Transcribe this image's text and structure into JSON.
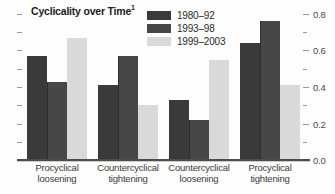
{
  "title": {
    "text": "Cyclicality over Time",
    "footnote_marker": "1"
  },
  "chart_data": {
    "type": "bar",
    "title": "Cyclicality over Time",
    "categories": [
      "Procyclical loosening",
      "Countercyclical tightening",
      "Countercyclical loosening",
      "Procyclical tightening"
    ],
    "series": [
      {
        "name": "1980–92",
        "color": "#3a3a3a",
        "values": [
          0.57,
          0.41,
          0.33,
          0.64
        ]
      },
      {
        "name": "1993–98",
        "color": "#474747",
        "values": [
          0.43,
          0.57,
          0.22,
          0.76
        ]
      },
      {
        "name": "1999–2003",
        "color": "#d9d9d9",
        "values": [
          0.67,
          0.3,
          0.55,
          0.41
        ]
      }
    ],
    "xlabel": "",
    "ylabel": "",
    "ylim": [
      0,
      0.8
    ],
    "yticks_right": [
      "0.0",
      "0.2",
      "0.4",
      "0.6",
      "0.8"
    ],
    "minor_tick_interval": 0.1,
    "major_tick_interval": 0.2,
    "grid": false,
    "legend_position": "top-center",
    "axis_labels_side": "right"
  },
  "colors": {
    "axis_line": "#4d4d4d",
    "tick": "#999999",
    "text": "#3a3a3a",
    "background": "#fdfdfd"
  }
}
